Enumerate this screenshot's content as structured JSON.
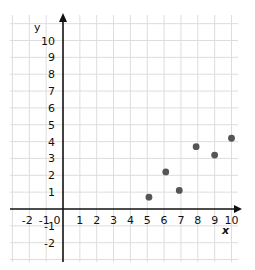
{
  "chart_data": {
    "type": "scatter",
    "title": "",
    "xlabel": "x",
    "ylabel": "y",
    "xlim": [
      -2,
      10
    ],
    "ylim": [
      -2,
      10
    ],
    "grid": true,
    "legend": null,
    "x_ticks": [
      "-2",
      "-1",
      "0",
      "1",
      "2",
      "3",
      "4",
      "5",
      "6",
      "7",
      "8",
      "9",
      "10"
    ],
    "y_ticks": [
      "10",
      "9",
      "8",
      "7",
      "6",
      "5",
      "4",
      "3",
      "2",
      "1",
      "-1",
      "-2"
    ],
    "series": [
      {
        "name": "points",
        "color": "#555555",
        "points": [
          {
            "x": 5.1,
            "y": 0.7
          },
          {
            "x": 6.1,
            "y": 2.2
          },
          {
            "x": 6.9,
            "y": 1.1
          },
          {
            "x": 7.9,
            "y": 3.7
          },
          {
            "x": 9.0,
            "y": 3.2
          },
          {
            "x": 10.0,
            "y": 4.2
          }
        ]
      }
    ]
  },
  "colors": {
    "grid": "#dddddd",
    "axis": "#111111",
    "point": "#555555"
  }
}
